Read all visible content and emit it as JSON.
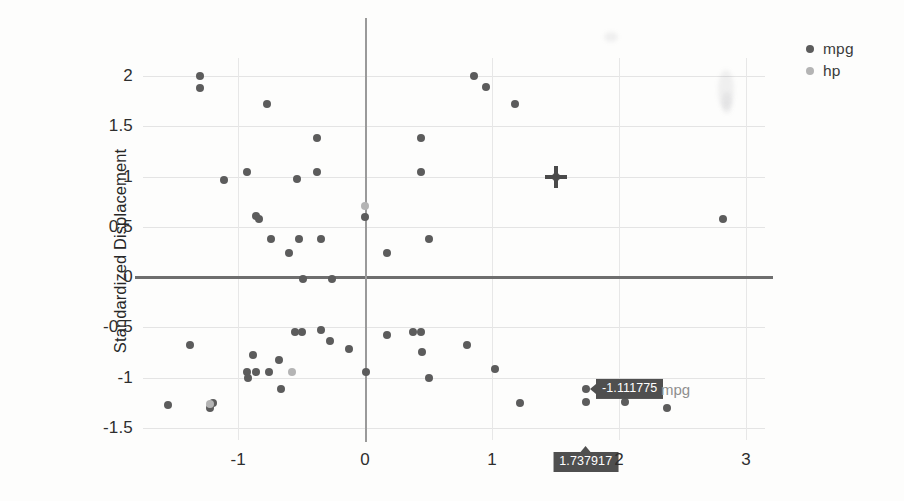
{
  "chart_data": {
    "type": "scatter",
    "title": "",
    "xlabel": "",
    "ylabel": "Standardized Displacement",
    "xlim": [
      -1.75,
      3.15
    ],
    "ylim": [
      -1.62,
      2.18
    ],
    "xticks": [
      "-1",
      "0",
      "1",
      "2",
      "3"
    ],
    "xtick_values": [
      -1,
      0,
      1,
      2,
      3
    ],
    "yticks": [
      "2",
      "1.5",
      "1",
      "0.5",
      "0",
      "-0.5",
      "-1",
      "-1.5"
    ],
    "ytick_values": [
      2,
      1.5,
      1,
      0.5,
      0,
      -0.5,
      -1,
      -1.5
    ],
    "grid": true,
    "legend_position": "top-right",
    "series": [
      {
        "name": "mpg",
        "color": "#5c5c5c",
        "points": [
          [
            -1.3,
            2.0
          ],
          [
            -1.3,
            1.88
          ],
          [
            -0.77,
            1.72
          ],
          [
            -0.38,
            1.38
          ],
          [
            -0.93,
            1.05
          ],
          [
            -0.54,
            0.98
          ],
          [
            -1.11,
            0.97
          ],
          [
            -0.38,
            1.05
          ],
          [
            -0.86,
            0.61
          ],
          [
            -0.84,
            0.58
          ],
          [
            -0.74,
            0.38
          ],
          [
            -0.52,
            0.38
          ],
          [
            -0.35,
            0.38
          ],
          [
            -0.6,
            0.24
          ],
          [
            -0.49,
            -0.02
          ],
          [
            -0.26,
            -0.02
          ],
          [
            0.0,
            0.6
          ],
          [
            0.17,
            0.24
          ],
          [
            0.44,
            1.38
          ],
          [
            0.44,
            1.05
          ],
          [
            0.5,
            0.38
          ],
          [
            0.86,
            2.0
          ],
          [
            0.95,
            1.89
          ],
          [
            1.18,
            1.72
          ],
          [
            1.5,
            1.0
          ],
          [
            2.82,
            0.58
          ],
          [
            -1.38,
            -0.67
          ],
          [
            -1.55,
            -1.27
          ],
          [
            -1.22,
            -1.3
          ],
          [
            -1.2,
            -1.25
          ],
          [
            -0.93,
            -0.94
          ],
          [
            -0.92,
            -1.0
          ],
          [
            -0.88,
            -0.77
          ],
          [
            -0.86,
            -0.94
          ],
          [
            -0.76,
            -0.94
          ],
          [
            -0.68,
            -0.82
          ],
          [
            -0.66,
            -1.11
          ],
          [
            -0.55,
            -0.55
          ],
          [
            -0.5,
            -0.55
          ],
          [
            -0.35,
            -0.53
          ],
          [
            -0.28,
            -0.64
          ],
          [
            -0.13,
            -0.71
          ],
          [
            0.01,
            -0.94
          ],
          [
            0.17,
            -0.58
          ],
          [
            0.38,
            -0.55
          ],
          [
            0.44,
            -0.55
          ],
          [
            0.45,
            -0.74
          ],
          [
            0.5,
            -1.0
          ],
          [
            0.8,
            -0.67
          ],
          [
            1.02,
            -0.91
          ],
          [
            1.22,
            -1.25
          ],
          [
            1.74,
            -1.11
          ],
          [
            1.74,
            -1.24
          ],
          [
            2.05,
            -1.24
          ],
          [
            2.38,
            -1.3
          ]
        ]
      },
      {
        "name": "hp",
        "color": "#b4b4b4",
        "points": [
          [
            0.0,
            0.71
          ],
          [
            -0.58,
            -0.94
          ],
          [
            -1.22,
            -1.26
          ]
        ]
      }
    ],
    "highlight": {
      "crosshair_x": 1.5,
      "crosshair_y": 1.0
    },
    "tooltips": {
      "y_value": "-1.111775",
      "y_series_label": "mpg",
      "x_value": "1.737917"
    }
  },
  "legend": {
    "items": [
      {
        "label": "mpg",
        "color": "#5c5c5c",
        "marker": "dot-icon"
      },
      {
        "label": "hp",
        "color": "#b4b4b4",
        "marker": "dot-icon"
      }
    ]
  }
}
